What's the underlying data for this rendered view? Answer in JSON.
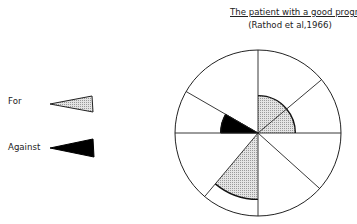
{
  "title": {
    "line1": "The patient with a good prognosis",
    "line2": "(Rathod et al,1966)"
  },
  "legend": [
    {
      "label": "For",
      "style": "dotted-grey",
      "color": "#dcdcdc"
    },
    {
      "label": "Against",
      "style": "solid-black",
      "color": "#000000"
    }
  ],
  "diagram": {
    "type": "polar-sector-chart",
    "divisions": 8,
    "spokes_deg": [
      90,
      40,
      0,
      -42,
      -90,
      -130,
      180,
      150
    ],
    "sectors": [
      {
        "from_deg": 40,
        "to_deg": 90,
        "radius_frac": 0.45,
        "kind": "For"
      },
      {
        "from_deg": 0,
        "to_deg": 40,
        "radius_frac": 0.45,
        "kind": "For"
      },
      {
        "from_deg": 150,
        "to_deg": 180,
        "radius_frac": 0.45,
        "kind": "Against"
      },
      {
        "from_deg": -130,
        "to_deg": -90,
        "radius_frac": 0.8,
        "kind": "For"
      }
    ]
  }
}
